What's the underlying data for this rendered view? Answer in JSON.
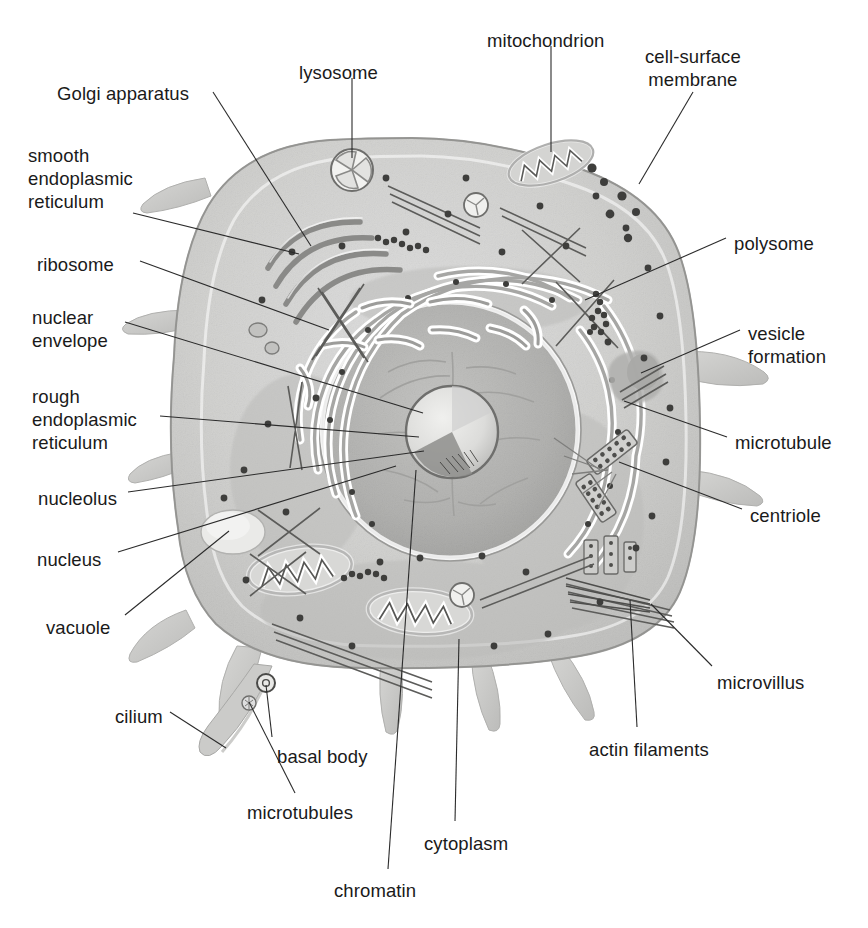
{
  "figure": {
    "title_fragment_cut_off_top": "a p          t   i           g",
    "label_count": 22
  },
  "palette": {
    "background": "#ffffff",
    "text": "#1a1a1a",
    "leader_line": "#2b2b2b",
    "cytoplasm_light": "#d8d8d6",
    "cytoplasm_mid": "#c6c6c4",
    "cytoplasm_dark": "#b4b4b2",
    "membrane_band": "#9a9a98",
    "nucleus_fill": "#b9b9b7",
    "nucleolus_fill": "#e8e8e6",
    "er_highlight": "#ffffff",
    "er_core": "#a8a8a6",
    "organelle_outline": "#6d6d6b",
    "ribosome_dot": "#4a4a48",
    "projection_fill": "#cfcfcd"
  },
  "labels": [
    {
      "id": "golgi-apparatus",
      "text": "Golgi apparatus",
      "side": "left",
      "align": "left",
      "x": 57,
      "y": 82,
      "lines": 1
    },
    {
      "id": "lysosome",
      "text": "lysosome",
      "side": "top",
      "align": "left",
      "x": 299,
      "y": 61,
      "lines": 1
    },
    {
      "id": "mitochondrion",
      "text": "mitochondrion",
      "side": "top",
      "align": "left",
      "x": 487,
      "y": 29,
      "lines": 1
    },
    {
      "id": "cell-surface-membrane",
      "text": "cell-surface\nmembrane",
      "side": "top-right",
      "align": "center",
      "x": 645,
      "y": 45,
      "lines": 2
    },
    {
      "id": "smooth-er",
      "text": "smooth\nendoplasmic\nreticulum",
      "side": "left",
      "align": "left",
      "x": 28,
      "y": 144,
      "lines": 3
    },
    {
      "id": "ribosome",
      "text": "ribosome",
      "side": "left",
      "align": "left",
      "x": 37,
      "y": 253,
      "lines": 1
    },
    {
      "id": "nuclear-envelope",
      "text": "nuclear\nenvelope",
      "side": "left",
      "align": "left",
      "x": 32,
      "y": 306,
      "lines": 2
    },
    {
      "id": "rough-er",
      "text": "rough\nendoplasmic\nreticulum",
      "side": "left",
      "align": "left",
      "x": 32,
      "y": 385,
      "lines": 3
    },
    {
      "id": "nucleolus",
      "text": "nucleolus",
      "side": "left",
      "align": "left",
      "x": 38,
      "y": 487,
      "lines": 1
    },
    {
      "id": "nucleus",
      "text": "nucleus",
      "side": "left",
      "align": "left",
      "x": 37,
      "y": 548,
      "lines": 1
    },
    {
      "id": "vacuole",
      "text": "vacuole",
      "side": "left",
      "align": "left",
      "x": 46,
      "y": 616,
      "lines": 1
    },
    {
      "id": "polysome",
      "text": "polysome",
      "side": "right",
      "align": "left",
      "x": 734,
      "y": 232,
      "lines": 1
    },
    {
      "id": "vesicle-formation",
      "text": "vesicle\nformation",
      "side": "right",
      "align": "left",
      "x": 748,
      "y": 322,
      "lines": 2
    },
    {
      "id": "microtubule",
      "text": "microtubule",
      "side": "right",
      "align": "left",
      "x": 735,
      "y": 431,
      "lines": 1
    },
    {
      "id": "centriole",
      "text": "centriole",
      "side": "right",
      "align": "left",
      "x": 750,
      "y": 504,
      "lines": 1
    },
    {
      "id": "microvillus",
      "text": "microvillus",
      "side": "right",
      "align": "left",
      "x": 717,
      "y": 671,
      "lines": 1
    },
    {
      "id": "actin-filaments",
      "text": "actin filaments",
      "side": "bottom",
      "align": "left",
      "x": 589,
      "y": 738,
      "lines": 1
    },
    {
      "id": "cytoplasm",
      "text": "cytoplasm",
      "side": "bottom",
      "align": "left",
      "x": 424,
      "y": 832,
      "lines": 1
    },
    {
      "id": "chromatin",
      "text": "chromatin",
      "side": "bottom",
      "align": "left",
      "x": 334,
      "y": 879,
      "lines": 1
    },
    {
      "id": "microtubules",
      "text": "microtubules",
      "side": "bottom",
      "align": "left",
      "x": 247,
      "y": 801,
      "lines": 1
    },
    {
      "id": "basal-body",
      "text": "basal body",
      "side": "bottom",
      "align": "left",
      "x": 277,
      "y": 745,
      "lines": 1
    },
    {
      "id": "cilium",
      "text": "cilium",
      "side": "bottom",
      "align": "left",
      "x": 115,
      "y": 705,
      "lines": 1
    }
  ],
  "leaders": [
    {
      "id": "leader-golgi",
      "from": [
        213,
        92
      ],
      "to": [
        311,
        246
      ]
    },
    {
      "id": "leader-lysosome",
      "from": [
        352,
        78
      ],
      "to": [
        352,
        158
      ]
    },
    {
      "id": "leader-mitochondrion",
      "from": [
        551,
        46
      ],
      "to": [
        551,
        152
      ]
    },
    {
      "id": "leader-cell-surface",
      "from": [
        693,
        92
      ],
      "to": [
        639,
        184
      ]
    },
    {
      "id": "leader-smooth-er",
      "from": [
        133,
        213
      ],
      "to": [
        299,
        254
      ]
    },
    {
      "id": "leader-ribosome",
      "from": [
        140,
        261
      ],
      "to": [
        329,
        330
      ]
    },
    {
      "id": "leader-nuclear-envelope",
      "from": [
        125,
        322
      ],
      "to": [
        423,
        413
      ]
    },
    {
      "id": "leader-rough-er",
      "from": [
        160,
        416
      ],
      "to": [
        419,
        437
      ]
    },
    {
      "id": "leader-nucleolus",
      "from": [
        128,
        492
      ],
      "to": [
        424,
        451
      ]
    },
    {
      "id": "leader-nucleus",
      "from": [
        118,
        552
      ],
      "to": [
        396,
        466
      ]
    },
    {
      "id": "leader-vacuole",
      "from": [
        125,
        615
      ],
      "to": [
        229,
        531
      ]
    },
    {
      "id": "leader-polysome",
      "from": [
        726,
        238
      ],
      "to": [
        585,
        300
      ]
    },
    {
      "id": "leader-vesicle-formation",
      "from": [
        740,
        330
      ],
      "to": [
        641,
        373
      ]
    },
    {
      "id": "leader-microtubule",
      "from": [
        727,
        437
      ],
      "to": [
        624,
        401
      ]
    },
    {
      "id": "leader-centriole",
      "from": [
        742,
        509
      ],
      "to": [
        619,
        462
      ]
    },
    {
      "id": "leader-microvillus",
      "from": [
        712,
        666
      ],
      "to": [
        651,
        604
      ]
    },
    {
      "id": "leader-actin-filaments",
      "from": [
        637,
        727
      ],
      "to": [
        630,
        600
      ]
    },
    {
      "id": "leader-cytoplasm",
      "from": [
        455,
        821
      ],
      "to": [
        459,
        639
      ]
    },
    {
      "id": "leader-chromatin",
      "from": [
        388,
        869
      ],
      "to": [
        416,
        470
      ]
    },
    {
      "id": "leader-microtubules",
      "from": [
        295,
        793
      ],
      "to": [
        249,
        702
      ]
    },
    {
      "id": "leader-basal-body",
      "from": [
        272,
        737
      ],
      "to": [
        266,
        685
      ]
    },
    {
      "id": "leader-cilium",
      "from": [
        170,
        712
      ],
      "to": [
        226,
        748
      ]
    }
  ],
  "structures": {
    "cell_outline": "rounded blob, microvilli and cilium projections",
    "organelles": [
      "nucleus",
      "nucleolus",
      "chromatin",
      "nuclear envelope",
      "rough endoplasmic reticulum",
      "smooth endoplasmic reticulum",
      "Golgi apparatus",
      "mitochondrion",
      "lysosome",
      "vacuole",
      "centriole",
      "microtubule",
      "ribosome",
      "polysome",
      "vesicle formation",
      "actin filaments",
      "microvillus",
      "cilium",
      "basal body",
      "cell-surface membrane",
      "cytoplasm"
    ]
  }
}
